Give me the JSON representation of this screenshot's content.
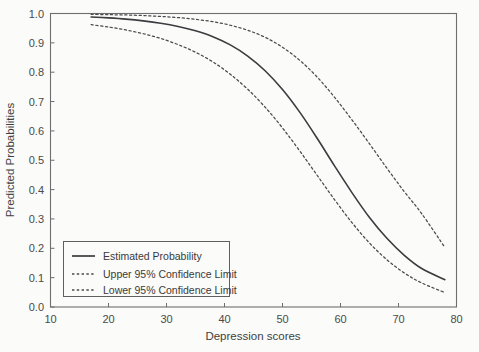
{
  "chart_data": {
    "type": "line",
    "title": "",
    "xlabel": "Depression scores",
    "ylabel": "Predicted Probabilities",
    "xlim": [
      10,
      80
    ],
    "ylim": [
      0.0,
      1.0
    ],
    "xticks": [
      10,
      20,
      30,
      40,
      50,
      60,
      70,
      80
    ],
    "xtick_labels": [
      "10",
      "20",
      "30",
      "40",
      "50",
      "60",
      "70",
      "80"
    ],
    "yticks": [
      0.0,
      0.1,
      0.2,
      0.3,
      0.4,
      0.5,
      0.6,
      0.7,
      0.8,
      0.9,
      1.0
    ],
    "ytick_labels": [
      "0.0",
      "0.1",
      "0.2",
      "0.3",
      "0.4",
      "0.5",
      "0.6",
      "0.7",
      "0.8",
      "0.9",
      "1.0"
    ],
    "grid": false,
    "legend_position": "lower left",
    "x": [
      17,
      20,
      23,
      26,
      29,
      32,
      35,
      38,
      41,
      44,
      47,
      50,
      53,
      56,
      59,
      62,
      65,
      68,
      71,
      74,
      78
    ],
    "series": [
      {
        "name": "Estimated Probability",
        "style": "solid",
        "values": [
          0.988,
          0.985,
          0.981,
          0.975,
          0.967,
          0.956,
          0.941,
          0.921,
          0.893,
          0.855,
          0.805,
          0.741,
          0.663,
          0.574,
          0.48,
          0.389,
          0.305,
          0.234,
          0.176,
          0.131,
          0.093
        ]
      },
      {
        "name": "Upper 95% Confidence Limit",
        "style": "dashed",
        "values": [
          0.997,
          0.996,
          0.995,
          0.993,
          0.99,
          0.986,
          0.98,
          0.972,
          0.96,
          0.943,
          0.919,
          0.885,
          0.84,
          0.783,
          0.714,
          0.637,
          0.556,
          0.473,
          0.393,
          0.318,
          0.203
        ]
      },
      {
        "name": "Lower 95% Confidence Limit",
        "style": "dashed",
        "values": [
          0.962,
          0.954,
          0.944,
          0.931,
          0.915,
          0.894,
          0.868,
          0.835,
          0.793,
          0.742,
          0.681,
          0.61,
          0.531,
          0.448,
          0.365,
          0.287,
          0.218,
          0.161,
          0.116,
          0.082,
          0.049
        ]
      }
    ]
  },
  "legend": {
    "items": [
      {
        "label": "Estimated Probability",
        "style": "solid"
      },
      {
        "label": "Upper 95% Confidence Limit",
        "style": "dashed"
      },
      {
        "label": "Lower 95% Confidence Limit",
        "style": "dashed"
      }
    ]
  },
  "colors": {
    "background": "#fbfbf9",
    "ink": "#3c3c40",
    "axis": "#6e6e70"
  }
}
